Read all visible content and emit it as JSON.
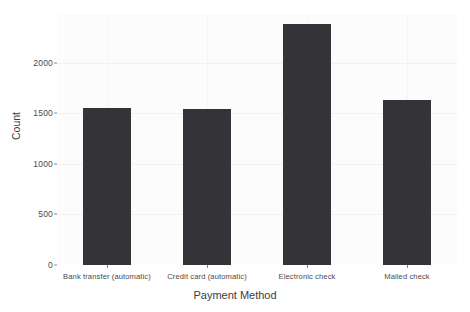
{
  "chart_data": {
    "type": "bar",
    "title": "",
    "xlabel": "Payment Method",
    "ylabel": "Count",
    "categories": [
      "Bank transfer (automatic)",
      "Credit card (automatic)",
      "Electronic check",
      "Mailed check"
    ],
    "values": [
      1552,
      1542,
      2378,
      1632
    ],
    "ylim": [
      0,
      2480
    ],
    "yticks": [
      0,
      500,
      1000,
      1500,
      2000
    ],
    "ytick_labels": [
      "0",
      "500",
      "1000",
      "1500",
      "2000"
    ],
    "grid": true,
    "legend": "none",
    "bar_color": "#333338",
    "plot_background": "#fcfcfc",
    "figure_background": "#ffffff",
    "grid_color": "#f1f1f1",
    "text_color": "#3c3c3c"
  }
}
